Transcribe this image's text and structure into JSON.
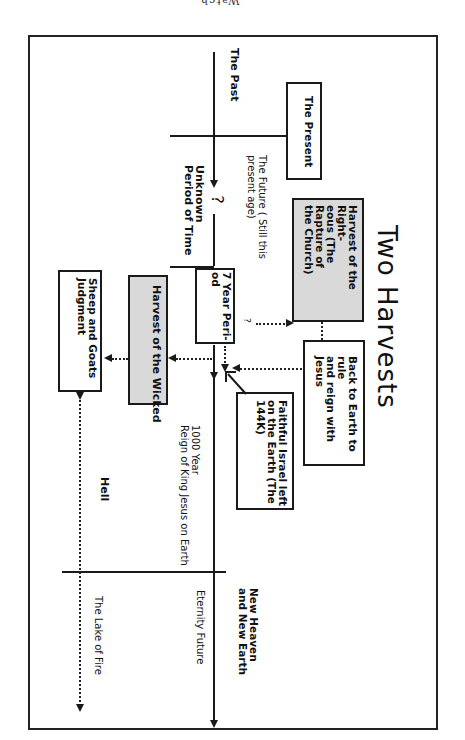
{
  "header": {
    "text": "Watch"
  },
  "diagram": {
    "title": "Two Harvests",
    "timeline_labels": {
      "past": "The Past",
      "present": "The Present",
      "future": "The Future ( Still this\npresent age)",
      "unknown": "Unknown\nPeriod of Time",
      "question": "?",
      "question_small": "?",
      "seven_year": "7 Year Peri-\nod",
      "millennium": "1000 Year\nReign of King Jesus on Earth",
      "new_heaven": "New Heaven\nand New Earth",
      "eternity": "Eternity Future",
      "hell": "Hell",
      "lake_of_fire": "The Lake of Fire"
    },
    "boxes": {
      "harvest_righteous": "Harvest of the Right-\neous  (The Rapture of\nthe Church)",
      "back_to_earth": "Back to Earth to rule\nand reign with Jesus",
      "faithful_israel": "Faithful Israel left\non the Earth (The\n144K)",
      "harvest_wicked": "Harvest of the Wicked",
      "sheep_goats": "Sheep and Goats\nJudgment"
    },
    "colors": {
      "line": "#1a1a1a",
      "shaded_box": "#d9d9d9",
      "background": "#ffffff"
    }
  }
}
